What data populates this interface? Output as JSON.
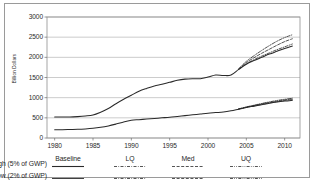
{
  "chart_data": {
    "type": "line",
    "title": "",
    "xlabel": "",
    "ylabel": "Billion Dollars",
    "xlim": [
      1979,
      2012
    ],
    "ylim": [
      0,
      3000
    ],
    "grid": true,
    "xticks": [
      "1980",
      "1985",
      "1990",
      "1995",
      "2000",
      "2005",
      "2010"
    ],
    "yticks": [
      "0",
      "500",
      "1000",
      "1500",
      "2000",
      "2500",
      "3000"
    ],
    "legend_position": "below-axes",
    "x": [
      1980,
      1981,
      1982,
      1983,
      1984,
      1985,
      1986,
      1987,
      1988,
      1989,
      1990,
      1991,
      1992,
      1993,
      1994,
      1995,
      1996,
      1997,
      1998,
      1999,
      2000,
      2001,
      2002,
      2003,
      2004,
      2005,
      2006,
      2007,
      2008,
      2009,
      2010,
      2011
    ],
    "series": [
      {
        "name": "High (5% of GWP) Baseline",
        "group": "High (5% of GWP)",
        "scenario": "Baseline",
        "style": "solid",
        "values": [
          520,
          520,
          520,
          530,
          545,
          570,
          640,
          730,
          850,
          960,
          1060,
          1160,
          1230,
          1290,
          1330,
          1380,
          1430,
          1460,
          1470,
          1470,
          1510,
          1560,
          1550,
          1560,
          1700,
          1830,
          1920,
          2000,
          2080,
          2150,
          2220,
          2280
        ]
      },
      {
        "name": "High (5% of GWP) LQ",
        "group": "High (5% of GWP)",
        "scenario": "LQ",
        "style": "dash-dot",
        "values": [
          null,
          null,
          null,
          null,
          null,
          null,
          null,
          null,
          null,
          null,
          null,
          null,
          null,
          null,
          null,
          null,
          null,
          null,
          null,
          null,
          null,
          null,
          null,
          null,
          1700,
          1840,
          1940,
          2030,
          2110,
          2190,
          2260,
          2330
        ]
      },
      {
        "name": "High (5% of GWP) Med",
        "group": "High (5% of GWP)",
        "scenario": "Med",
        "style": "dashed",
        "values": [
          null,
          null,
          null,
          null,
          null,
          null,
          null,
          null,
          null,
          null,
          null,
          null,
          null,
          null,
          null,
          null,
          null,
          null,
          null,
          null,
          null,
          null,
          null,
          null,
          1710,
          1870,
          1990,
          2100,
          2200,
          2300,
          2390,
          2460
        ]
      },
      {
        "name": "High (5% of GWP) UQ",
        "group": "High (5% of GWP)",
        "scenario": "UQ",
        "style": "dash-dot-dot",
        "values": [
          null,
          null,
          null,
          null,
          null,
          null,
          null,
          null,
          null,
          null,
          null,
          null,
          null,
          null,
          null,
          null,
          null,
          null,
          null,
          null,
          null,
          null,
          null,
          null,
          1720,
          1900,
          2040,
          2170,
          2290,
          2400,
          2490,
          2560
        ]
      },
      {
        "name": "Low (2% of GWP) Baseline",
        "group": "Low (2% of GWP)",
        "scenario": "Baseline",
        "style": "solid",
        "values": [
          205,
          205,
          210,
          215,
          225,
          240,
          265,
          300,
          345,
          395,
          440,
          455,
          470,
          485,
          500,
          515,
          535,
          555,
          575,
          595,
          615,
          630,
          645,
          675,
          715,
          755,
          790,
          825,
          860,
          890,
          915,
          935
        ]
      },
      {
        "name": "Low (2% of GWP) LQ",
        "group": "Low (2% of GWP)",
        "scenario": "LQ",
        "style": "dash-dot",
        "values": [
          null,
          null,
          null,
          null,
          null,
          null,
          null,
          null,
          null,
          null,
          null,
          null,
          null,
          null,
          null,
          null,
          null,
          null,
          null,
          null,
          null,
          null,
          null,
          null,
          718,
          760,
          797,
          833,
          868,
          900,
          928,
          950
        ]
      },
      {
        "name": "Low (2% of GWP) Med",
        "group": "Low (2% of GWP)",
        "scenario": "Med",
        "style": "dashed",
        "values": [
          null,
          null,
          null,
          null,
          null,
          null,
          null,
          null,
          null,
          null,
          null,
          null,
          null,
          null,
          null,
          null,
          null,
          null,
          null,
          null,
          null,
          null,
          null,
          null,
          720,
          765,
          805,
          845,
          882,
          916,
          946,
          970
        ]
      },
      {
        "name": "Low (2% of GWP) UQ",
        "group": "Low (2% of GWP)",
        "scenario": "UQ",
        "style": "dash-dot-dot",
        "values": [
          null,
          null,
          null,
          null,
          null,
          null,
          null,
          null,
          null,
          null,
          null,
          null,
          null,
          null,
          null,
          null,
          null,
          null,
          null,
          null,
          null,
          null,
          null,
          null,
          722,
          770,
          813,
          856,
          895,
          930,
          960,
          985
        ]
      }
    ]
  },
  "legend": {
    "row_labels": [
      "High (5% of GWP)",
      "Low (2% of GWP)"
    ],
    "column_headers": [
      "Baseline",
      "LQ",
      "Med",
      "UQ"
    ]
  }
}
